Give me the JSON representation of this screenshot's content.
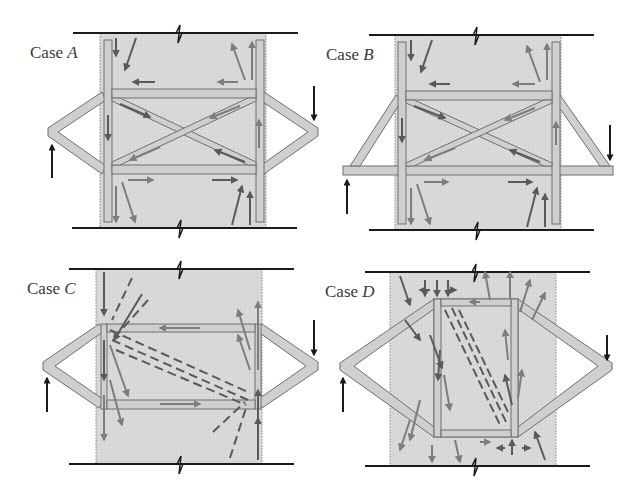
{
  "figure": {
    "colors": {
      "concrete": "#d9d9d9",
      "steel": "#cfcfcf",
      "steel_edge": "#6f6f6f",
      "flow_arrow": "#7d7d7d",
      "dark_flow": "#5a5a5a",
      "load_arrow": "#1a1a1a",
      "boundary_line": "#1a1a1a"
    },
    "panels": [
      {
        "id": "A",
        "prefix": "Case ",
        "letter": "A",
        "note": "Cross-braced steel insert, diamond-shaped external brace"
      },
      {
        "id": "B",
        "prefix": "Case ",
        "letter": "B",
        "note": "Cross-braced steel insert, triangular brace with through-beam"
      },
      {
        "id": "C",
        "prefix": "Case ",
        "letter": "C",
        "note": "Open frame insert with diagonal compression strut (dashed)"
      },
      {
        "id": "D",
        "prefix": "Case ",
        "letter": "D",
        "note": "Rectangular insert with diamond brace framing into corners"
      }
    ],
    "loads": {
      "left": "upward arrow (applied force)",
      "right": "downward arrow (applied force)"
    }
  }
}
